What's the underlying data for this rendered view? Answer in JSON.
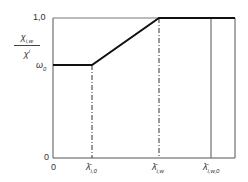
{
  "diagram": {
    "y_axis": {
      "label_numerator": "χ",
      "label_numerator_sub": "i,w",
      "label_denominator": "χ",
      "label_denominator_sup": "i",
      "ticks": [
        {
          "label": "1,0",
          "value": 1.0
        },
        {
          "label": "ω",
          "sub": "0",
          "value": "omega_0"
        },
        {
          "label": "0",
          "value": 0
        }
      ]
    },
    "x_axis": {
      "ticks": [
        {
          "label": "0"
        },
        {
          "label": "λ̄",
          "sub": "i,0"
        },
        {
          "label": "λ̄",
          "sub": "i,w"
        },
        {
          "label": "λ̄",
          "sub": "i,w,0"
        }
      ]
    },
    "curve": {
      "description": "constant at ω0 until λ̄i,0, linear rise to 1,0 at λ̄i,w, constant 1,0 beyond",
      "points": [
        {
          "x": "0",
          "y": "ω0"
        },
        {
          "x": "λ̄i,0",
          "y": "ω0"
        },
        {
          "x": "λ̄i,w",
          "y": "1,0"
        },
        {
          "x": "end",
          "y": "1,0"
        }
      ]
    },
    "colors": {
      "line": "#111111",
      "axis": "#555555",
      "dashed": "#333333"
    }
  }
}
